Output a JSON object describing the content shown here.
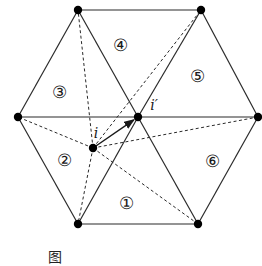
{
  "diagram": {
    "type": "hexagonal-mesh-triangulation",
    "stroke_color": "#2a2a2a",
    "point_color": "#000000",
    "vertices": [
      {
        "id": "top-left",
        "x": 78,
        "y": 10
      },
      {
        "id": "top-right",
        "x": 201,
        "y": 10
      },
      {
        "id": "left",
        "x": 18,
        "y": 117
      },
      {
        "id": "center",
        "x": 138,
        "y": 117
      },
      {
        "id": "right",
        "x": 258,
        "y": 117
      },
      {
        "id": "bottom-left",
        "x": 78,
        "y": 224
      },
      {
        "id": "bottom-right",
        "x": 198,
        "y": 224
      }
    ],
    "interior_point": {
      "id": "i",
      "x": 93,
      "y": 148
    },
    "solid_edges": [
      [
        "top-left",
        "top-right"
      ],
      [
        "top-left",
        "left"
      ],
      [
        "top-left",
        "center"
      ],
      [
        "top-right",
        "center"
      ],
      [
        "top-right",
        "right"
      ],
      [
        "left",
        "center"
      ],
      [
        "center",
        "right"
      ],
      [
        "left",
        "bottom-left"
      ],
      [
        "center",
        "bottom-left"
      ],
      [
        "center",
        "bottom-right"
      ],
      [
        "right",
        "bottom-right"
      ],
      [
        "bottom-left",
        "bottom-right"
      ]
    ],
    "dashed_edges_from_i": [
      "top-left",
      "top-right",
      "left",
      "right",
      "bottom-left",
      "bottom-right"
    ],
    "arrow": {
      "from": "i",
      "to": "center"
    },
    "point_labels": {
      "i": {
        "text": "i",
        "x": 96,
        "y": 138
      },
      "i_prime": {
        "text": "i′",
        "x": 154,
        "y": 110
      }
    },
    "regions": [
      {
        "label": "①",
        "x": 126,
        "y": 203
      },
      {
        "label": "②",
        "x": 64,
        "y": 160
      },
      {
        "label": "③",
        "x": 59,
        "y": 92
      },
      {
        "label": "④",
        "x": 120,
        "y": 45
      },
      {
        "label": "⑤",
        "x": 197,
        "y": 76
      },
      {
        "label": "⑥",
        "x": 212,
        "y": 161
      }
    ]
  },
  "caption": {
    "figure_label": "图",
    "text": "",
    "clipped": true
  }
}
